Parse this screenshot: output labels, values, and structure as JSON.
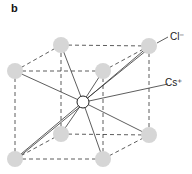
{
  "panel_label": "b",
  "labels": {
    "anion": "Cl⁻",
    "cation": "Cs⁺"
  },
  "colors": {
    "anion_fill": "#d6d6d6",
    "cation_fill": "#ffffff",
    "line": "#333333"
  },
  "structure": "CsCl body-centered cubic unit cell",
  "corners": [
    {
      "name": "top-back-left",
      "x": 61,
      "y": 45
    },
    {
      "name": "top-back-right",
      "x": 149,
      "y": 46
    },
    {
      "name": "top-front-left",
      "x": 15,
      "y": 71
    },
    {
      "name": "top-front-right",
      "x": 103,
      "y": 71
    },
    {
      "name": "bottom-back-left",
      "x": 61,
      "y": 134
    },
    {
      "name": "bottom-back-right",
      "x": 149,
      "y": 135
    },
    {
      "name": "bottom-front-left",
      "x": 15,
      "y": 159
    },
    {
      "name": "bottom-front-right",
      "x": 103,
      "y": 159
    }
  ],
  "center": {
    "x": 83,
    "y": 102
  }
}
